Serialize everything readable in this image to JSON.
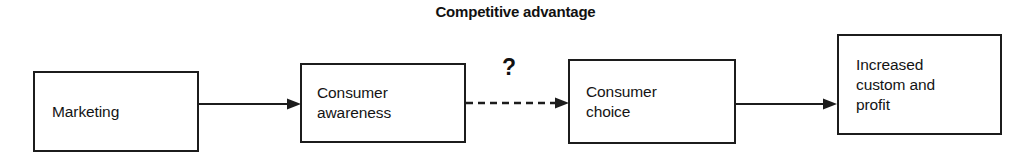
{
  "diagram": {
    "title": "Competitive advantage",
    "background_color": "#ffffff",
    "line_color": "#1c1c1c",
    "text_color": "#141414",
    "nodes": [
      {
        "id": "marketing",
        "label": "Marketing"
      },
      {
        "id": "consumer-awareness",
        "label": "Consumer\nawareness"
      },
      {
        "id": "consumer-choice",
        "label": "Consumer\nchoice"
      },
      {
        "id": "increased-custom",
        "label": "Increased\ncustom and\nprofit"
      }
    ],
    "connectors": [
      {
        "id": "marketing-awareness",
        "style": "solid",
        "arrowhead": "filled-triangle",
        "label": ""
      },
      {
        "id": "awareness-choice",
        "style": "dashed",
        "arrowhead": "filled-triangle",
        "label": "?"
      },
      {
        "id": "choice-increased",
        "style": "solid",
        "arrowhead": "filled-triangle",
        "label": ""
      }
    ],
    "uncertainty_marker": "?"
  }
}
